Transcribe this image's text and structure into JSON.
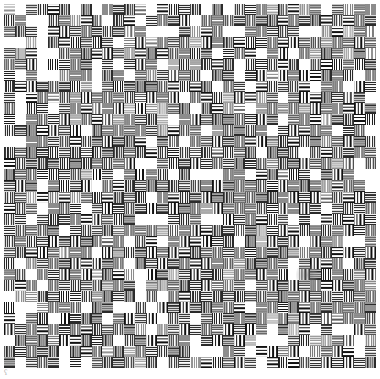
{
  "canvas": {
    "width": 380,
    "height": 379,
    "background_color": "#ffffff"
  },
  "plate": {
    "name": "resolution-test-pattern",
    "left": 4,
    "top": 4,
    "width": 372,
    "height": 364,
    "columns": 34,
    "rows": 33,
    "cell_pitch_px": 11,
    "line_color": "#1a1a1a",
    "gap_color": "#ffffff",
    "description": "Checkerboard of alternating horizontal and vertical high-frequency line-bundle cells forming a moire resolution target"
  },
  "artifacts": {
    "smudge": {
      "name": "grey-smudge",
      "left": 296,
      "top": 262,
      "width": 22,
      "height": 26,
      "color": "#787878"
    },
    "corner_mark": {
      "name": "corner-artifact",
      "left": 4,
      "top": 369,
      "glyph": "ʕ",
      "color": "#b8b8b8"
    }
  },
  "chart_data": {
    "type": "heatmap",
    "title": "",
    "xlabel": "",
    "ylabel": "",
    "grid": {
      "columns": 34,
      "rows": 33,
      "cell_pitch_px": 11
    },
    "cell_types": [
      "h",
      "v",
      "b",
      "hf",
      "vf",
      "hc",
      "vc"
    ],
    "cell_type_labels": {
      "h": "horizontal line bundle",
      "v": "vertical line bundle",
      "b": "blank",
      "hf": "horizontal fine pitch",
      "vf": "vertical fine pitch",
      "hc": "horizontal coarse pitch",
      "vc": "vertical coarse pitch"
    },
    "legend": [],
    "grid_on": false,
    "values": []
  }
}
